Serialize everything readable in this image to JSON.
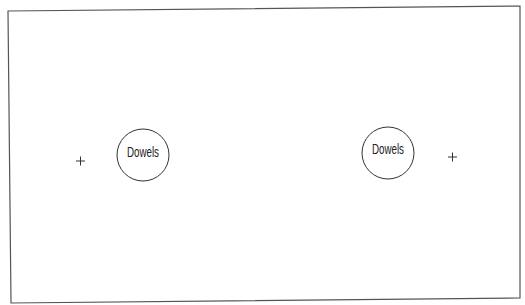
{
  "diagram": {
    "board": {
      "corners": [
        [
          8,
          11
        ],
        [
          520,
          6
        ],
        [
          520,
          298
        ],
        [
          11,
          303
        ]
      ],
      "stroke": "#555555"
    },
    "dowels": [
      {
        "label": "Dowels",
        "cx": 143,
        "cy": 155,
        "r": 26
      },
      {
        "label": "Dowels",
        "cx": 388,
        "cy": 153,
        "r": 26
      }
    ],
    "marks": [
      {
        "symbol": "+",
        "x": 80,
        "y": 161
      },
      {
        "symbol": "+",
        "x": 452,
        "y": 157
      }
    ]
  }
}
